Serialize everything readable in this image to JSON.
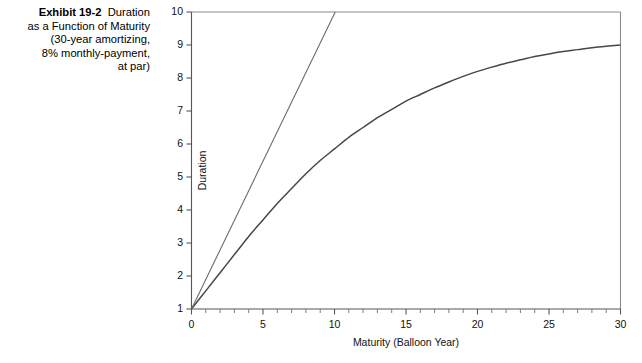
{
  "exhibit": {
    "number": "Exhibit 19-2",
    "line1": "Duration",
    "line2": "as a Function of Maturity",
    "line3": "(30-year amortizing,",
    "line4": "8% monthly-payment,",
    "line5": "at par)"
  },
  "chart_data": {
    "type": "line",
    "title": "",
    "xlabel": "Maturity (Balloon Year)",
    "ylabel": "Duration",
    "xlim": [
      0,
      30
    ],
    "ylim": [
      1,
      10
    ],
    "grid": false,
    "legend": "none",
    "x_ticks": [
      0,
      5,
      10,
      15,
      20,
      25,
      30
    ],
    "x_tick_labels": [
      "0",
      "5",
      "10",
      "15",
      "20",
      "25",
      "30"
    ],
    "x_minor_tick_step": 1,
    "y_ticks": [
      1,
      2,
      3,
      4,
      5,
      6,
      7,
      8,
      9,
      10
    ],
    "y_tick_labels": [
      "1",
      "2",
      "3",
      "4",
      "5",
      "6",
      "7",
      "8",
      "9",
      "10"
    ],
    "series": [
      {
        "name": "Duration of amortizing balloon mortgage",
        "style": "solid-curve",
        "color": "#46474b",
        "x": [
          0,
          1,
          2,
          3,
          4,
          5,
          6,
          7,
          8,
          9,
          10,
          11,
          12,
          13,
          14,
          15,
          16,
          17,
          18,
          19,
          20,
          21,
          22,
          23,
          24,
          25,
          26,
          27,
          28,
          29,
          30
        ],
        "y": [
          1.0,
          1.55,
          2.1,
          2.65,
          3.2,
          3.7,
          4.2,
          4.65,
          5.1,
          5.5,
          5.85,
          6.2,
          6.5,
          6.8,
          7.05,
          7.3,
          7.5,
          7.7,
          7.88,
          8.05,
          8.2,
          8.33,
          8.45,
          8.55,
          8.65,
          8.73,
          8.8,
          8.86,
          8.92,
          8.96,
          9.0
        ]
      },
      {
        "name": "Duration of non-amortizing reference (straight line)",
        "style": "straight-line",
        "color": "#6a6b70",
        "x": [
          0,
          10.05
        ],
        "y": [
          1.0,
          10.0
        ]
      }
    ]
  }
}
